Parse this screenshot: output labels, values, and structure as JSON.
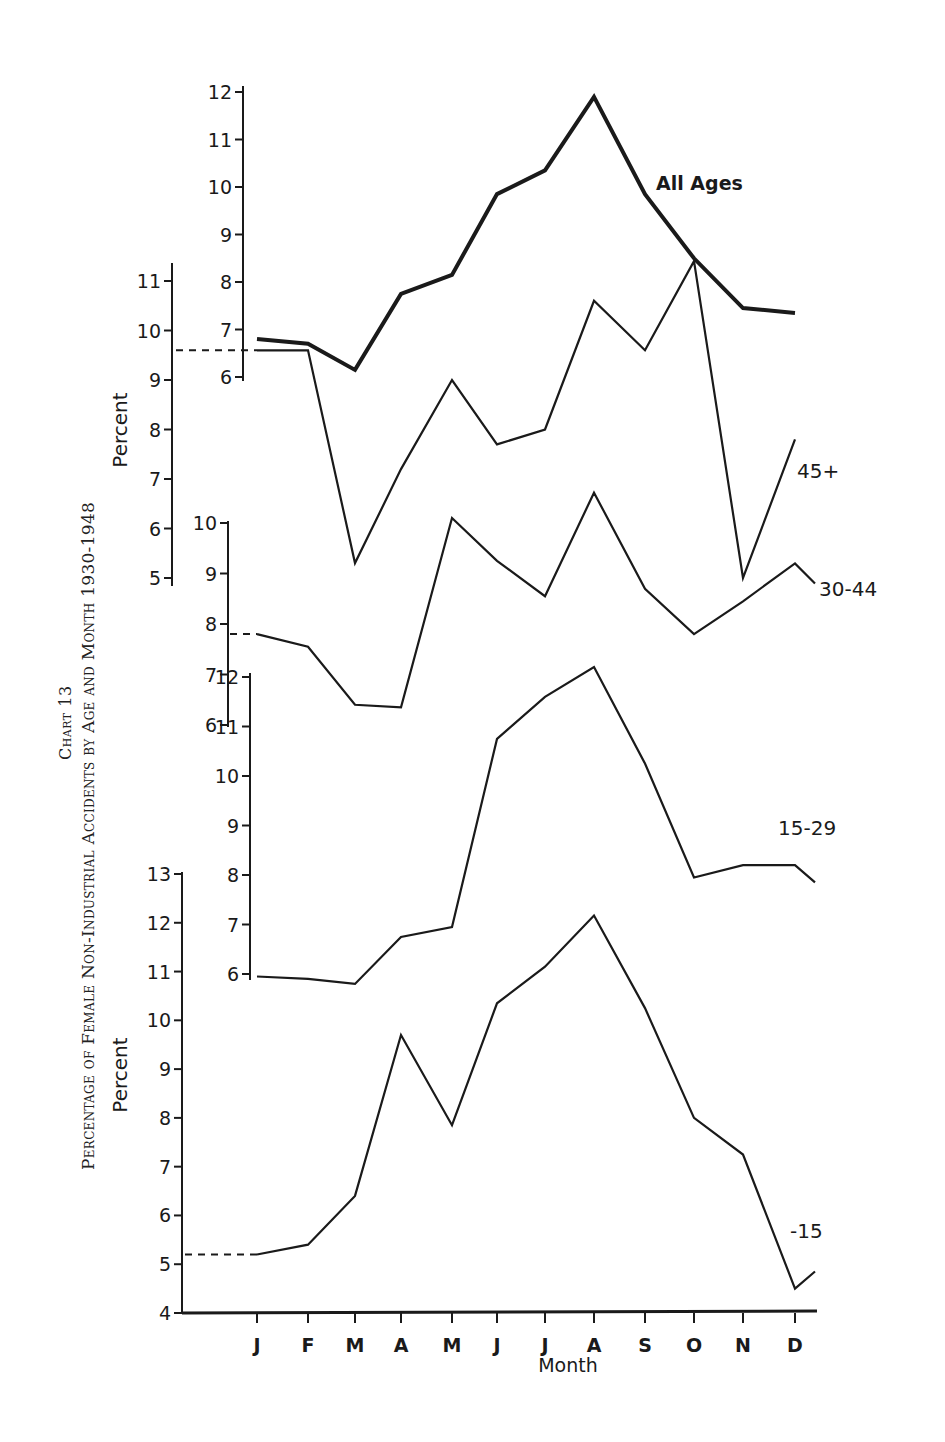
{
  "title": {
    "chart_number": "Chart 13",
    "main": "Percentage of Female Non-Industrial Accidents by Age and Month 1930-1948"
  },
  "axes": {
    "xlabel": "Month",
    "ylabel": "Percent",
    "months": [
      "J",
      "F",
      "M",
      "A",
      "M",
      "J",
      "J",
      "A",
      "S",
      "O",
      "N",
      "D"
    ]
  },
  "colors": {
    "ink": "#1a1a1a",
    "background": "#ffffff"
  },
  "chart_data": {
    "type": "line",
    "title": "Percentage of Female Non-Industrial Accidents by Age and Month 1930-1948",
    "xlabel": "Month",
    "ylabel": "Percent",
    "categories": [
      "J",
      "F",
      "M",
      "A",
      "M",
      "J",
      "J",
      "A",
      "S",
      "O",
      "N",
      "D"
    ],
    "layout": "stacked panels with separate offset y-axes per series; grid off; series labelled at right end",
    "series": [
      {
        "name": "All Ages",
        "y_ticks": [
          6,
          7,
          8,
          9,
          10,
          11,
          12
        ],
        "ylim": [
          6,
          12
        ],
        "values": [
          6.8,
          6.7,
          6.15,
          7.75,
          8.15,
          9.85,
          10.35,
          11.9,
          9.85,
          8.5,
          7.45,
          7.35
        ],
        "line_weight": "heavy"
      },
      {
        "name": "45+",
        "y_ticks": [
          5,
          6,
          7,
          8,
          9,
          10,
          11
        ],
        "ylim": [
          5,
          11
        ],
        "values": [
          9.6,
          9.6,
          5.3,
          7.2,
          9.0,
          7.7,
          8.0,
          10.6,
          9.6,
          11.4,
          5.0,
          7.8
        ],
        "dashed_lead_in": 9.6
      },
      {
        "name": "30-44",
        "y_ticks": [
          6,
          7,
          8,
          9,
          10
        ],
        "ylim": [
          6,
          10
        ],
        "values": [
          7.8,
          7.55,
          6.4,
          6.35,
          10.1,
          9.25,
          8.55,
          10.6,
          8.7,
          7.8,
          8.45,
          9.2
        ],
        "tail_after_D": 8.8,
        "dashed_lead_in": 7.8
      },
      {
        "name": "15-29",
        "y_ticks": [
          6,
          7,
          8,
          9,
          10,
          11,
          12
        ],
        "ylim": [
          6,
          12
        ],
        "values": [
          5.95,
          5.9,
          5.8,
          6.75,
          6.95,
          10.75,
          11.6,
          12.2,
          10.25,
          7.95,
          8.2,
          8.2
        ],
        "tail_after_D": 7.85
      },
      {
        "name": "-15",
        "y_ticks": [
          4,
          5,
          6,
          7,
          8,
          9,
          10,
          11,
          12,
          13
        ],
        "ylim": [
          4,
          13
        ],
        "values": [
          5.2,
          5.4,
          6.4,
          9.7,
          7.85,
          10.35,
          11.1,
          12.15,
          10.25,
          8.0,
          7.25,
          4.5
        ],
        "tail_after_D": 4.85,
        "dashed_lead_in": 5.2
      }
    ]
  },
  "render": {
    "month_x": [
      257,
      308,
      355,
      401,
      452,
      497,
      545,
      594,
      645,
      694,
      743,
      795
    ],
    "panels": [
      {
        "series": 0,
        "axis_x": 243,
        "y_at_min": 377,
        "y_at_max": 92,
        "label_x": 656,
        "label_y": 190,
        "label_size": 19,
        "label_weight": "bold",
        "stroke": 4,
        "lead_from": null,
        "axis_top": 86,
        "axis_bottom": 381
      },
      {
        "series": 1,
        "axis_x": 172,
        "y_at_min": 578,
        "y_at_max": 281,
        "label_x": 797,
        "label_y": 478,
        "label_size": 20,
        "label_weight": "normal",
        "stroke": 2.2,
        "lead_from": 176,
        "axis_top": 263,
        "axis_bottom": 586
      },
      {
        "series": 2,
        "axis_x": 228,
        "y_at_min": 725,
        "y_at_max": 523,
        "label_x": 819,
        "label_y": 596,
        "label_size": 20,
        "label_weight": "normal",
        "stroke": 2.2,
        "lead_from": 230,
        "axis_top": 521,
        "axis_bottom": 727
      },
      {
        "series": 3,
        "axis_x": 250,
        "y_at_min": 974,
        "y_at_max": 677,
        "label_x": 778,
        "label_y": 835,
        "label_size": 20,
        "label_weight": "normal",
        "stroke": 2.2,
        "lead_from": null,
        "axis_top": 673,
        "axis_bottom": 980
      },
      {
        "series": 4,
        "axis_x": 182,
        "y_at_min": 1313,
        "y_at_max": 874,
        "label_x": 790,
        "label_y": 1238,
        "label_size": 20,
        "label_weight": "normal",
        "stroke": 2.2,
        "lead_from": 185,
        "axis_top": 872,
        "axis_bottom": 1313
      }
    ],
    "x_axis": {
      "y": 1313,
      "x_start": 182,
      "x_end": 817,
      "month_label_y": 1352,
      "xlabel_x": 568,
      "xlabel_y": 1372
    },
    "ylabels": [
      {
        "x": 127,
        "y": 430
      },
      {
        "x": 127,
        "y": 1075
      }
    ]
  }
}
